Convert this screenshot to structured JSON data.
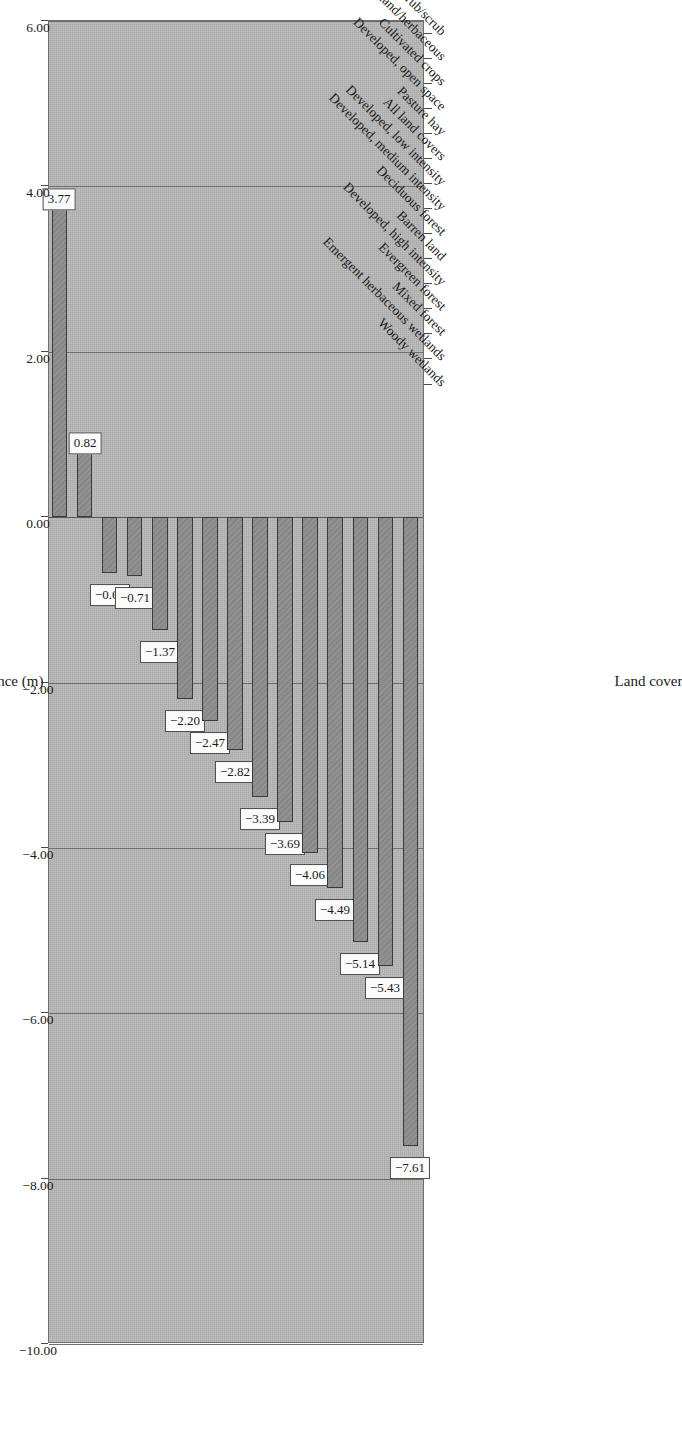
{
  "chart_data": {
    "type": "bar",
    "orientation": "vertical-columns-rotated",
    "title": "Absolute vertical accuracy: GDEM vs. GPS benchmarks",
    "xlabel": "Land cover",
    "ylabel": "Mean difference (m)",
    "ylim": [
      -10.0,
      6.0
    ],
    "grid": true,
    "legend": "none",
    "categories": [
      "Woody wetlands",
      "Emergent herbaceous wetlands",
      "Mixed forest",
      "Evergreen forest",
      "Developed, high intensity",
      "Barren land",
      "Deciduous forest",
      "Developed, medium intensity",
      "Developed, low intensity",
      "All land covers",
      "Pasture hay",
      "Developed, open space",
      "Cultivated crops",
      "Grassland/herbaceous",
      "Shrub/scrub"
    ],
    "values": [
      3.77,
      0.82,
      -0.68,
      -0.71,
      -1.37,
      -2.2,
      -2.47,
      -2.82,
      -3.39,
      -3.69,
      -4.06,
      -4.49,
      -5.14,
      -5.43,
      -7.61
    ],
    "data_labels": [
      "3.77",
      "0.82",
      "−0.68",
      "−0.71",
      "−1.37",
      "−2.20",
      "−2.47",
      "−2.82",
      "−3.39",
      "−3.69",
      "−4.06",
      "−4.49",
      "−5.14",
      "−5.43",
      "−7.61"
    ],
    "ytick_labels": [
      "6.00",
      "4.00",
      "2.00",
      "0.00",
      "−2.00",
      "−4.00",
      "−6.00",
      "−8.00",
      "−10.00"
    ],
    "ytick_values": [
      6,
      4,
      2,
      0,
      -2,
      -4,
      -6,
      -8,
      -10
    ],
    "colors": {
      "bar_fill": "#8b8b8b",
      "bar_border": "#3a3a3a",
      "plot_background": "#b7b7b7",
      "gridline": "#6f6f6f",
      "label_background": "#fbfbfb",
      "text": "#1a1a1a"
    }
  }
}
